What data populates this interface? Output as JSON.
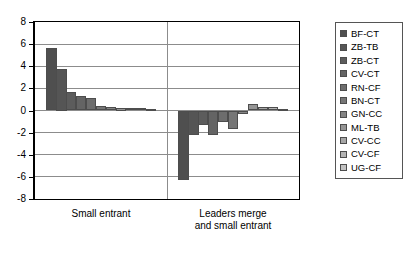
{
  "chart_data": {
    "type": "bar",
    "title": "",
    "subtitle": "",
    "xlabel": "",
    "ylabel": "",
    "ylim": [
      -8,
      8
    ],
    "ytick_values": [
      8,
      6,
      4,
      2,
      0,
      -2,
      -4,
      -6,
      -8
    ],
    "ytick_labels": [
      "8",
      "6",
      "4",
      "2",
      "0",
      "-2",
      "-4",
      "-6",
      "-8"
    ],
    "grid": true,
    "legend_position": "right",
    "categories": [
      "Small entrant",
      "Leaders merge\nand small entrant"
    ],
    "series": [
      {
        "name": "BF-CT",
        "color": "#4f4f4f",
        "values": [
          5.65,
          -6.3
        ]
      },
      {
        "name": "ZB-TB",
        "color": "#555555",
        "values": [
          3.75,
          -2.2
        ]
      },
      {
        "name": "ZB-CT",
        "color": "#5c5c5c",
        "values": [
          1.7,
          -1.3
        ]
      },
      {
        "name": "CV-CT",
        "color": "#646464",
        "values": [
          1.35,
          -2.2
        ]
      },
      {
        "name": "RN-CF",
        "color": "#6d6d6d",
        "values": [
          1.1,
          -1.0
        ]
      },
      {
        "name": "BN-CT",
        "color": "#767676",
        "values": [
          0.45,
          -1.7
        ]
      },
      {
        "name": "GN-CC",
        "color": "#848484",
        "values": [
          0.32,
          -0.35
        ]
      },
      {
        "name": "ML-TB",
        "color": "#959595",
        "values": [
          0.25,
          0.55
        ]
      },
      {
        "name": "CV-CC",
        "color": "#a6a6a6",
        "values": [
          0.22,
          0.32
        ]
      },
      {
        "name": "CV-CF",
        "color": "#b4b4b4",
        "values": [
          0.2,
          0.3
        ]
      },
      {
        "name": "UG-CF",
        "color": "#c2c2c2",
        "values": [
          0.15,
          0.18
        ]
      }
    ]
  },
  "legend": {
    "items": [
      {
        "label": "BF-CT"
      },
      {
        "label": "ZB-TB"
      },
      {
        "label": "ZB-CT"
      },
      {
        "label": "CV-CT"
      },
      {
        "label": "RN-CF"
      },
      {
        "label": "BN-CT"
      },
      {
        "label": "GN-CC"
      },
      {
        "label": "ML-TB"
      },
      {
        "label": "CV-CC"
      },
      {
        "label": "CV-CF"
      },
      {
        "label": "UG-CF"
      }
    ]
  },
  "axis": {
    "y_labels": [
      "8",
      "6",
      "4",
      "2",
      "0",
      "-2",
      "-4",
      "-6",
      "-8"
    ],
    "x_labels": [
      "Small entrant",
      "Leaders merge\nand small entrant"
    ]
  },
  "colors": {
    "grid": "#8c8c8c",
    "frame": "#000000",
    "bar_stroke": "#4d4d4d",
    "background": "#ffffff"
  }
}
